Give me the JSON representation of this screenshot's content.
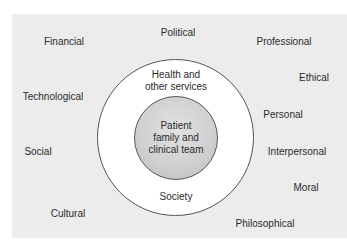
{
  "diagram": {
    "type": "concentric-circles",
    "inner_circle": {
      "label_lines": [
        "Patient",
        "family and",
        "clinical team"
      ]
    },
    "middle_ring": {
      "top_label_lines": [
        "Health and",
        "other services"
      ],
      "bottom_label": "Society"
    },
    "outer_factors": [
      {
        "label": "Financial"
      },
      {
        "label": "Political"
      },
      {
        "label": "Professional"
      },
      {
        "label": "Ethical"
      },
      {
        "label": "Technological"
      },
      {
        "label": "Personal"
      },
      {
        "label": "Social"
      },
      {
        "label": "Interpersonal"
      },
      {
        "label": "Moral"
      },
      {
        "label": "Cultural"
      },
      {
        "label": "Philosophical"
      }
    ],
    "colors": {
      "background": "#ececec",
      "ring": "#ffffff",
      "core": "#cfcfcf",
      "stroke": "#555555",
      "text": "#2b2b2b"
    }
  }
}
